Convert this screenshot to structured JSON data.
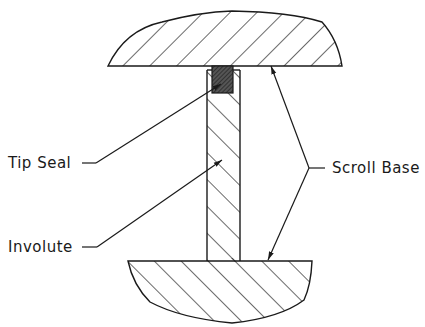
{
  "diagram": {
    "type": "cross-section",
    "labels": {
      "tip_seal": "Tip Seal",
      "involute": "Involute",
      "scroll_base": "Scroll Base"
    },
    "colors": {
      "line": "#1a1a1a",
      "seal_fill": "#444444",
      "background": "#ffffff"
    }
  }
}
